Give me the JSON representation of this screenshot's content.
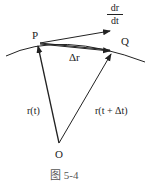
{
  "labels": {
    "point_p": "P",
    "point_q": "Q",
    "origin": "O",
    "delta_r": "Δr",
    "r_t": "r(t)",
    "r_t_dt": "r(t + Δt)",
    "deriv_num": "dr",
    "deriv_den": "dt"
  },
  "caption": "图 5-4"
}
